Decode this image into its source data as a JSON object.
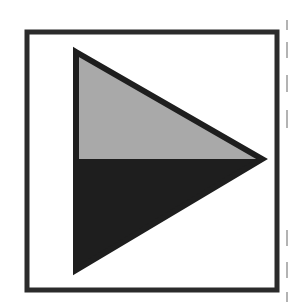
{
  "figure": {
    "icon": "play-triangle-icon",
    "frame": {
      "x": 27,
      "y": 32,
      "width": 250,
      "height": 258,
      "stroke_width": 5,
      "stroke_color": "#2b2b2b",
      "fill": "#ffffff"
    },
    "triangle": {
      "points": {
        "top": [
          76,
          52
        ],
        "tip": [
          262,
          159
        ],
        "bottom": [
          76,
          270
        ]
      },
      "split_y": 159,
      "upper_fill": "#a9a9a9",
      "lower_fill": "#1e1e1e",
      "outline_color": "#1e1e1e",
      "outline_width": 6
    },
    "edge_marks": {
      "x": 287,
      "color": "#9a9a9a",
      "segments": [
        [
          20,
          30
        ],
        [
          42,
          58
        ],
        [
          75,
          92
        ],
        [
          110,
          128
        ],
        [
          230,
          246
        ],
        [
          262,
          278
        ],
        [
          292,
          302
        ]
      ]
    }
  }
}
